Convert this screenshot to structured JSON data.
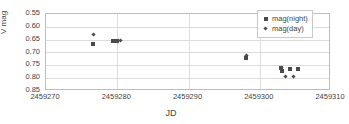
{
  "chart_data": {
    "type": "scatter",
    "title": "",
    "xlabel": "JD",
    "ylabel": "V mag",
    "xlim": [
      2459270,
      2459310
    ],
    "ylim": [
      0.55,
      0.85
    ],
    "y_inverted": true,
    "grid": "horizontal",
    "legend_position": "top-right",
    "xticks": [
      "2459270",
      "2459280",
      "2459290",
      "2459300",
      "2459310"
    ],
    "xtick_values": [
      2459270,
      2459280,
      2459290,
      2459300,
      2459310
    ],
    "yticks": [
      "0.55",
      "0.60",
      "0.65",
      "0.70",
      "0.75",
      "0.80",
      "0.85"
    ],
    "ytick_values": [
      0.55,
      0.6,
      0.65,
      0.7,
      0.75,
      0.8,
      0.85
    ],
    "series": [
      {
        "name": "mag(night)",
        "marker": "square",
        "color": "#4a4a4a",
        "points": [
          {
            "x": 2459276.6,
            "y": 0.666
          },
          {
            "x": 2459279.4,
            "y": 0.654
          },
          {
            "x": 2459279.9,
            "y": 0.654
          },
          {
            "x": 2459298.1,
            "y": 0.722
          },
          {
            "x": 2459303.0,
            "y": 0.762
          },
          {
            "x": 2459303.1,
            "y": 0.772
          },
          {
            "x": 2459304.3,
            "y": 0.765
          },
          {
            "x": 2459305.4,
            "y": 0.766
          }
        ]
      },
      {
        "name": "mag(day)",
        "marker": "diamond",
        "color": "#4a4a4a",
        "points": [
          {
            "x": 2459276.6,
            "y": 0.631
          },
          {
            "x": 2459280.4,
            "y": 0.654
          },
          {
            "x": 2459298.1,
            "y": 0.711
          },
          {
            "x": 2459303.0,
            "y": 0.758
          },
          {
            "x": 2459303.6,
            "y": 0.795
          },
          {
            "x": 2459304.8,
            "y": 0.793
          }
        ]
      }
    ]
  },
  "legend": {
    "items": [
      {
        "label": "mag(night)",
        "marker": "square-marker-icon"
      },
      {
        "label": "mag(day)",
        "marker": "diamond-marker-icon"
      }
    ]
  },
  "axes": {
    "x_title": "JD",
    "y_title": "V mag"
  }
}
